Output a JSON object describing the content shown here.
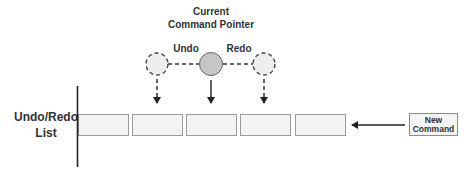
{
  "diagram": {
    "title": {
      "line1": "Current",
      "line2": "Command Pointer"
    },
    "pointer_labels": {
      "undo": "Undo",
      "redo": "Redo"
    },
    "list_label": {
      "line1": "Undo/Redo",
      "line2": "List"
    },
    "new_command": {
      "line1": "New",
      "line2": "Command"
    },
    "list_slots": [
      {
        "index": 0,
        "label": ""
      },
      {
        "index": 1,
        "label": ""
      },
      {
        "index": 2,
        "label": ""
      },
      {
        "index": 3,
        "label": ""
      },
      {
        "index": 4,
        "label": ""
      }
    ],
    "nodes": [
      {
        "name": "undo-position",
        "style": "dashed",
        "fill": "#eeeeee"
      },
      {
        "name": "current-pointer",
        "style": "solid",
        "fill": "#c6c6c6"
      },
      {
        "name": "redo-position",
        "style": "dashed",
        "fill": "#eeeeee"
      }
    ],
    "colors": {
      "line": "#222222",
      "slot_border": "#9a9a9a",
      "slot_fill": "#f3f3f3",
      "current_fill": "#c6c6c6",
      "ghost_fill": "#eeeeee"
    }
  }
}
